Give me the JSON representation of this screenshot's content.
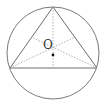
{
  "diagram": {
    "type": "geometry",
    "labels": {
      "center": "O"
    },
    "colors": {
      "stroke": "#7a7a7a",
      "dashed": "#a0a0a0",
      "point": "#111111",
      "background": "#ffffff"
    },
    "circle": {
      "cx": 53,
      "cy": 53,
      "r": 46
    },
    "triangle": {
      "vertices": [
        [
          53,
          7
        ],
        [
          10,
          68
        ],
        [
          97,
          68
        ]
      ]
    },
    "center_point": [
      53,
      55
    ],
    "dashed_segments": [
      [
        [
          53,
          7
        ],
        [
          53,
          68
        ]
      ],
      [
        [
          10,
          68
        ],
        [
          75,
          37
        ]
      ],
      [
        [
          97,
          68
        ],
        [
          31,
          37
        ]
      ]
    ]
  }
}
